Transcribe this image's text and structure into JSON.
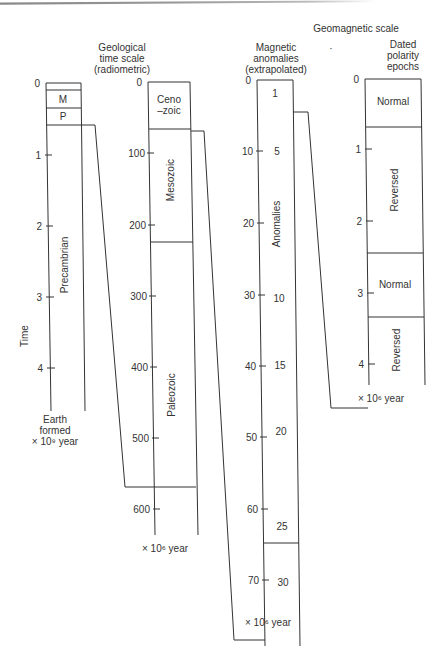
{
  "title": "Geomagnetic scale",
  "panels": {
    "earth": {
      "unit_line1": "Earth",
      "unit_line2": "formed",
      "unit_line3": "× 10⁹ year",
      "axis_label": "Time",
      "ticks": [
        "0",
        "1",
        "2",
        "3",
        "4"
      ],
      "segments": [
        "M",
        "P",
        "Precambrian"
      ]
    },
    "geological": {
      "heading1": "Geological",
      "heading2": "time scale",
      "heading3": "(radiometric)",
      "ticks": [
        "0",
        "100",
        "200",
        "300",
        "400",
        "500",
        "600"
      ],
      "segments": [
        "Ceno",
        "–zoic",
        "Mesozoic",
        "Paleozoic"
      ],
      "unit": "× 10⁶  year"
    },
    "magnetic": {
      "heading1": "Magnetic",
      "heading2": "anomalies",
      "heading3": "(extrapolated)",
      "ticks": [
        "0",
        "10",
        "20",
        "30",
        "40",
        "50",
        "60",
        "70"
      ],
      "anomaly_numbers": [
        "1",
        "5",
        "10",
        "15",
        "20",
        "25",
        "30"
      ],
      "label": "Anomalies",
      "unit": "× 10⁶  year"
    },
    "polarity": {
      "heading1": "Dated",
      "heading2": "polarity",
      "heading3": "epochs",
      "ticks": [
        "0",
        "1",
        "2",
        "3",
        "4"
      ],
      "segments": [
        "Normal",
        "Reversed",
        "Normal",
        "Reversed"
      ],
      "unit": "× 10⁶  year"
    }
  }
}
